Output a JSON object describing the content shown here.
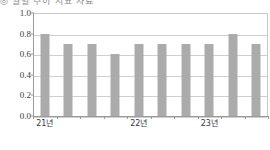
{
  "title": {
    "clipped_text": "◎ 월별 추이 지표 자료"
  },
  "chart_data": {
    "type": "bar",
    "title": "",
    "xlabel": "",
    "ylabel": "",
    "ylim": [
      0.0,
      1.0
    ],
    "grid": true,
    "legend": "none",
    "bar_color": "#ababab",
    "categories": [
      "1",
      "2",
      "3",
      "4",
      "5",
      "6",
      "7",
      "8",
      "9",
      "10"
    ],
    "values": [
      0.8,
      0.7,
      0.7,
      0.6,
      0.7,
      0.7,
      0.7,
      0.7,
      0.8,
      0.7
    ],
    "ytick_labels": [
      "0.0",
      "0.2",
      "0.4",
      "0.6",
      "0.8",
      "1.0"
    ],
    "ytick_values": [
      0.0,
      0.2,
      0.4,
      0.6,
      0.8,
      1.0
    ],
    "xtick_labels": [
      {
        "label": "21년",
        "at_index": 0
      },
      {
        "label": "22년",
        "at_index": 4
      },
      {
        "label": "23년",
        "at_index": 7
      }
    ]
  }
}
